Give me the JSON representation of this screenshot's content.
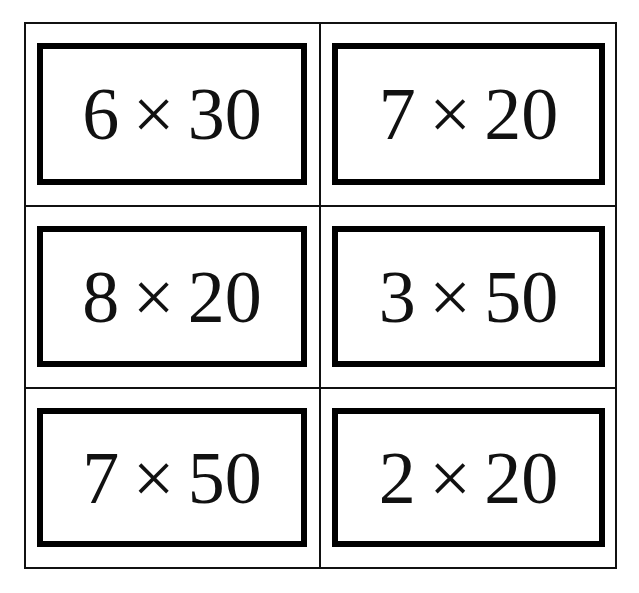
{
  "worksheet": {
    "cards": [
      {
        "left": "6",
        "operator": "×",
        "right": "30"
      },
      {
        "left": "7",
        "operator": "×",
        "right": "20"
      },
      {
        "left": "8",
        "operator": "×",
        "right": "20"
      },
      {
        "left": "3",
        "operator": "×",
        "right": "50"
      },
      {
        "left": "7",
        "operator": "×",
        "right": "50"
      },
      {
        "left": "2",
        "operator": "×",
        "right": "20"
      }
    ]
  }
}
